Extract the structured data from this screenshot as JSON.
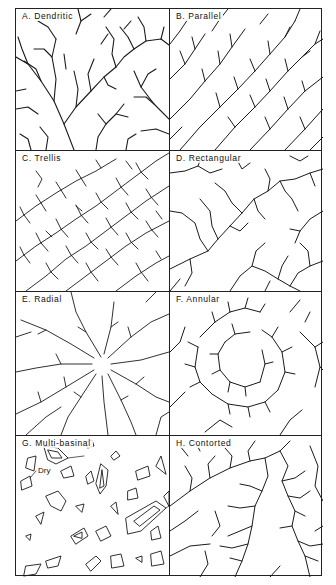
{
  "figure": {
    "panels": [
      {
        "id": "A",
        "label": "A.  Dendritic"
      },
      {
        "id": "B",
        "label": "B.  Parallel"
      },
      {
        "id": "C",
        "label": "C.  Trellis"
      },
      {
        "id": "D",
        "label": "D.  Rectangular"
      },
      {
        "id": "E",
        "label": "E.  Radial"
      },
      {
        "id": "F",
        "label": "F.  Annular"
      },
      {
        "id": "G",
        "label": "G.  Multi-basinal",
        "annotation": "Dry"
      },
      {
        "id": "H",
        "label": "H.  Contorted"
      }
    ],
    "line_color": "#1a1a1a",
    "background": "#ffffff"
  }
}
